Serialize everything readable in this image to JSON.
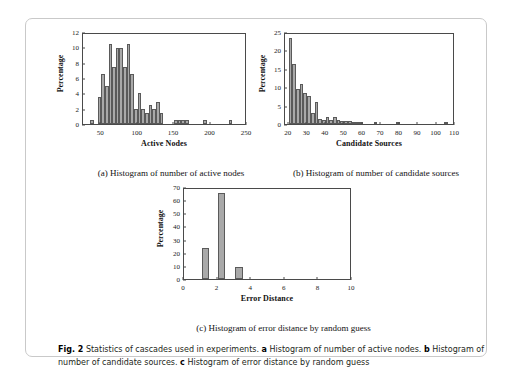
{
  "figure": {
    "number_label": "Fig. 2",
    "caption_intro": "Statistics of cascades used in experiments.",
    "caption_parts": [
      {
        "panel": "a",
        "text": "Histogram of number of active nodes."
      },
      {
        "panel": "b",
        "text": "Histogram of number of candidate sources."
      },
      {
        "panel": "c",
        "text": "Histogram of error distance by random guess"
      }
    ],
    "subcaptions": {
      "a": "(a) Histogram of number of active nodes",
      "b": "(b) Histogram of number of candidate sources",
      "c": "(c) Histogram of error distance by random guess"
    },
    "colors": {
      "bar_fill": "#a9a9a9",
      "bar_edge": "#5a5a5a",
      "axis": "#4a4a4a",
      "border": "#c9c9c9",
      "text": "#231f20"
    }
  },
  "chart_data": [
    {
      "id": "a",
      "type": "bar",
      "title": "",
      "xlabel": "Active Nodes",
      "ylabel": "Percentage",
      "xlim": [
        25,
        250
      ],
      "ylim": [
        0,
        12
      ],
      "xticks": [
        50,
        100,
        150,
        200,
        250
      ],
      "yticks": [
        0,
        2,
        4,
        6,
        8,
        10,
        12
      ],
      "grid": false,
      "bin_width": 5,
      "bin_starts": [
        35,
        40,
        45,
        50,
        55,
        60,
        65,
        70,
        75,
        80,
        85,
        90,
        95,
        100,
        105,
        110,
        115,
        120,
        125,
        130,
        135,
        150,
        155,
        160,
        165,
        190,
        225
      ],
      "values": [
        0.5,
        0.0,
        3.5,
        6.5,
        5.0,
        10.4,
        7.5,
        9.9,
        9.9,
        7.5,
        10.4,
        6.5,
        2.0,
        4.0,
        2.0,
        1.5,
        2.5,
        2.0,
        2.9,
        1.4,
        0.0,
        0.5,
        0.5,
        0.5,
        0.5,
        0.5,
        0.5
      ]
    },
    {
      "id": "b",
      "type": "bar",
      "title": "",
      "xlabel": "Candidate Sources",
      "ylabel": "Percentage",
      "xlim": [
        18,
        110
      ],
      "ylim": [
        0,
        25
      ],
      "xticks": [
        20,
        30,
        40,
        50,
        60,
        70,
        80,
        90,
        100,
        110
      ],
      "yticks": [
        0,
        5,
        10,
        15,
        20,
        25
      ],
      "grid": false,
      "bin_width": 2,
      "bin_starts": [
        20,
        22,
        24,
        26,
        28,
        30,
        32,
        34,
        36,
        38,
        40,
        42,
        44,
        46,
        48,
        50,
        52,
        54,
        56,
        58,
        66,
        78,
        104
      ],
      "values": [
        23.3,
        16.2,
        9.4,
        11.0,
        8.4,
        7.5,
        3.0,
        6.0,
        1.3,
        1.0,
        1.8,
        1.2,
        1.8,
        1.1,
        0.9,
        0.7,
        0.8,
        0.6,
        0.6,
        0.2,
        0.5,
        0.5,
        0.5
      ]
    },
    {
      "id": "c",
      "type": "bar",
      "title": "",
      "xlabel": "Error Distance",
      "ylabel": "Percentage",
      "xlim": [
        0,
        10
      ],
      "ylim": [
        0,
        70
      ],
      "xticks": [
        0,
        2,
        4,
        6,
        8,
        10
      ],
      "yticks": [
        0,
        10,
        20,
        30,
        40,
        50,
        60,
        70
      ],
      "grid": false,
      "bin_width": 0.45,
      "bin_starts": [
        1.05,
        2.0,
        3.05
      ],
      "values": [
        23.8,
        65.3,
        9.2
      ]
    }
  ]
}
